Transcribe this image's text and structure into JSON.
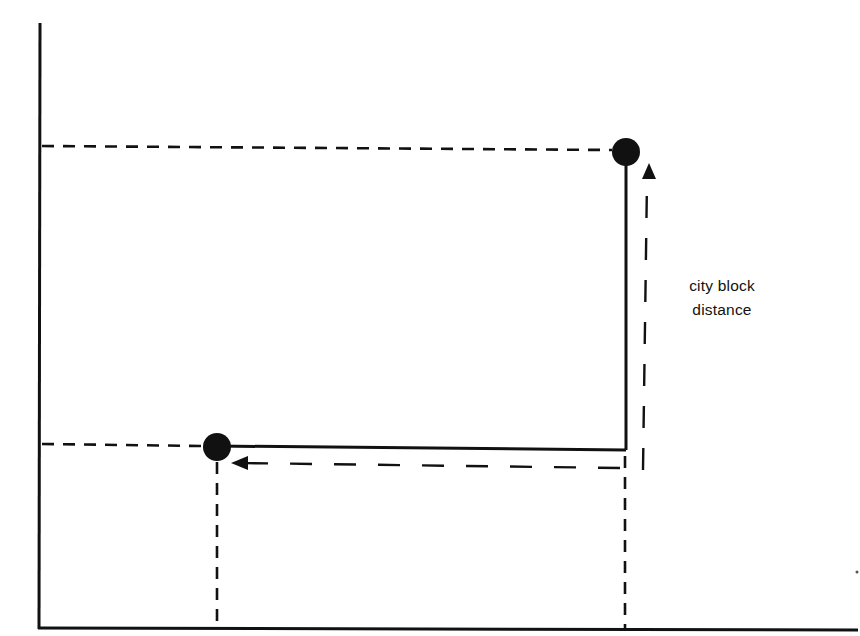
{
  "diagram": {
    "title": "",
    "type": "city-block-distance",
    "label": {
      "line1": "city block",
      "line2": "distance"
    },
    "axes": {
      "x_axis": {
        "label": "",
        "ticks": []
      },
      "y_axis": {
        "label": "",
        "ticks": []
      }
    },
    "points": [
      {
        "id": "point-a",
        "position": "lower-left",
        "px": [
          217,
          447
        ]
      },
      {
        "id": "point-b",
        "position": "upper-right",
        "px": [
          626,
          152
        ]
      }
    ],
    "paths": {
      "solid_horizontal": "from point A right to corner under point B",
      "solid_vertical": "from corner up to point B",
      "arrow_horizontal_direction": "left",
      "arrow_vertical_direction": "up"
    },
    "colors": {
      "ink": "#111111",
      "background": "#ffffff"
    }
  }
}
